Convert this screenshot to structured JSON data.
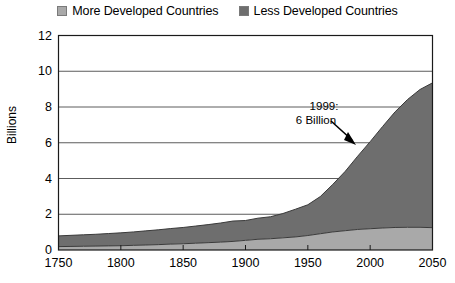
{
  "legend": {
    "items": [
      {
        "label": "More Developed Countries",
        "color": "#a9a9a9",
        "icon": "legend-swatch-icon"
      },
      {
        "label": "Less Developed Countries",
        "color": "#6e6e6e",
        "icon": "legend-swatch-icon"
      }
    ]
  },
  "axes": {
    "ylabel": "Billions",
    "yticks": [
      "0",
      "2",
      "4",
      "6",
      "8",
      "10",
      "12"
    ],
    "xticks": [
      "1750",
      "1800",
      "1850",
      "1900",
      "1950",
      "2000",
      "2050"
    ]
  },
  "annotation": {
    "line1": "1999:",
    "line2": "6 Billion"
  },
  "chart_data": {
    "type": "area",
    "title": "",
    "subtitle": "",
    "xlabel": "",
    "ylabel": "Billions",
    "xlim": [
      1750,
      2050
    ],
    "ylim": [
      0,
      12
    ],
    "grid": true,
    "legend_position": "top-center",
    "stacked": true,
    "x": [
      1750,
      1760,
      1770,
      1780,
      1790,
      1800,
      1810,
      1820,
      1830,
      1840,
      1850,
      1860,
      1870,
      1880,
      1890,
      1900,
      1910,
      1920,
      1930,
      1940,
      1950,
      1960,
      1970,
      1980,
      1990,
      2000,
      2010,
      2020,
      2030,
      2040,
      2050
    ],
    "series": [
      {
        "name": "More Developed Countries",
        "color": "#a9a9a9",
        "values": [
          0.19,
          0.2,
          0.21,
          0.22,
          0.23,
          0.24,
          0.26,
          0.28,
          0.3,
          0.33,
          0.35,
          0.38,
          0.41,
          0.44,
          0.48,
          0.54,
          0.6,
          0.63,
          0.68,
          0.73,
          0.81,
          0.91,
          1.01,
          1.08,
          1.15,
          1.19,
          1.23,
          1.26,
          1.27,
          1.27,
          1.25
        ]
      },
      {
        "name": "Less Developed Countries",
        "color": "#6e6e6e",
        "values": [
          0.6,
          0.62,
          0.64,
          0.66,
          0.69,
          0.72,
          0.75,
          0.79,
          0.83,
          0.87,
          0.91,
          0.96,
          1.01,
          1.07,
          1.14,
          1.11,
          1.18,
          1.23,
          1.36,
          1.55,
          1.72,
          2.08,
          2.66,
          3.32,
          4.1,
          4.87,
          5.68,
          6.47,
          7.15,
          7.71,
          8.1
        ]
      }
    ],
    "totals": [
      0.79,
      0.82,
      0.85,
      0.88,
      0.92,
      0.96,
      1.01,
      1.07,
      1.13,
      1.2,
      1.26,
      1.34,
      1.42,
      1.51,
      1.62,
      1.65,
      1.78,
      1.86,
      2.04,
      2.28,
      2.53,
      2.99,
      3.67,
      4.4,
      5.25,
      6.06,
      6.91,
      7.73,
      8.42,
      8.98,
      9.35
    ],
    "annotations": [
      {
        "text": "1999: 6 Billion",
        "x": 1999,
        "y": 6.0,
        "arrow": true
      }
    ]
  }
}
